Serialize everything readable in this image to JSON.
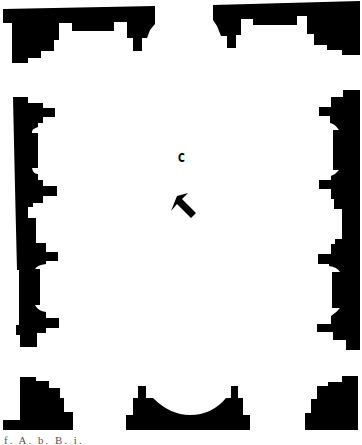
{
  "diagram": {
    "type": "architectural-floor-plan",
    "room_label": "C",
    "arrow": {
      "direction": "north-west",
      "icon": "arrow-up-left-icon"
    },
    "caption": "f. A. b. B. i.",
    "colors": {
      "wall": "#000000",
      "background": "#ffffff"
    },
    "elements": [
      "top-left-corner-block",
      "top-right-corner-block",
      "left-wall-with-two-apses",
      "right-wall-with-two-apses",
      "bottom-left-corner-block",
      "bottom-center-apse",
      "bottom-right-corner-block"
    ]
  }
}
